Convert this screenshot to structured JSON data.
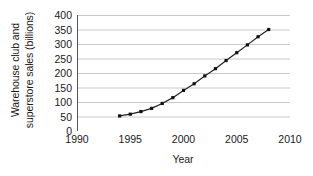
{
  "chart_data": {
    "type": "line",
    "title": "",
    "xlabel": "Year",
    "ylabel": "Warehouse club and superstore sales (billions)",
    "ylabel_line1": "Warehouse club and",
    "ylabel_line2": "superstore sales (billions)",
    "xlim": [
      1990,
      2010
    ],
    "ylim": [
      0,
      400
    ],
    "xticks": [
      1990,
      1995,
      2000,
      2005,
      2010
    ],
    "yticks": [
      0,
      50,
      100,
      150,
      200,
      250,
      300,
      350,
      400
    ],
    "grid": "horizontal",
    "legend": "none",
    "marker": "square",
    "line_color": "#222222",
    "marker_color": "#111111",
    "grid_color": "#c9c9c9",
    "axis_color": "#555555",
    "background": "#ffffff",
    "x": [
      1994,
      1995,
      1996,
      1997,
      1998,
      1999,
      2000,
      2001,
      2002,
      2003,
      2004,
      2005,
      2006,
      2007,
      2008
    ],
    "values": [
      52,
      58,
      67,
      78,
      95,
      115,
      140,
      163,
      190,
      215,
      243,
      270,
      297,
      325,
      350
    ],
    "series": [
      {
        "name": "Warehouse club and superstore sales",
        "values": [
          52,
          58,
          67,
          78,
          95,
          115,
          140,
          163,
          190,
          215,
          243,
          270,
          297,
          325,
          350
        ]
      }
    ]
  }
}
